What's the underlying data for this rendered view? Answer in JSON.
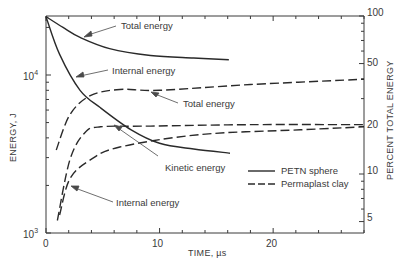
{
  "chart_data": {
    "type": "line",
    "title": "",
    "xlabel": "TIME, µs",
    "ylabel": "ENERGY, J",
    "ylabel_right": "PERCENT TOTAL ENERGY",
    "xlim": [
      0,
      28
    ],
    "ylim": [
      1000,
      23600
    ],
    "yscale": "log",
    "x_ticks": [
      0,
      10,
      20
    ],
    "x_tick_labels": [
      "0",
      "10",
      "20"
    ],
    "y_ticks": [
      1000,
      10000
    ],
    "y_tick_labels": [
      "10^3",
      "10^4"
    ],
    "y_right_ticks": [
      5,
      10,
      20,
      50,
      100
    ],
    "y_right_tick_labels": [
      "5",
      "10",
      "20",
      "50",
      "100"
    ],
    "grid": false,
    "legend": {
      "position": "lower-right",
      "entries": [
        {
          "label": "PETN sphere",
          "style": "solid"
        },
        {
          "label": "Permaplast clay",
          "style": "dashed"
        }
      ]
    },
    "series": [
      {
        "name": "Total energy (PETN sphere)",
        "group": "PETN sphere",
        "style": "solid",
        "x": [
          0,
          1.5,
          3,
          5.6,
          9.2,
          13,
          16.1
        ],
        "y": [
          23400,
          20000,
          17300,
          14700,
          13300,
          12800,
          12500
        ]
      },
      {
        "name": "Internal energy (PETN sphere)",
        "group": "PETN sphere",
        "style": "solid",
        "x": [
          0,
          1.2,
          3,
          4.8,
          7.5,
          10,
          13,
          16.2
        ],
        "y": [
          23400,
          13500,
          8000,
          6200,
          4500,
          3700,
          3400,
          3200
        ]
      },
      {
        "name": "Total energy (Permaplast clay)",
        "group": "Permaplast clay",
        "style": "dashed",
        "x": [
          0.9,
          2.1,
          3.9,
          6.5,
          10,
          18,
          28
        ],
        "y": [
          3350,
          5600,
          7400,
          8100,
          8000,
          8700,
          9400
        ]
      },
      {
        "name": "Kinetic energy (Permaplast clay)",
        "group": "Permaplast clay",
        "style": "dashed",
        "x": [
          1.0,
          2.1,
          3.4,
          4.8,
          9.2,
          18,
          28
        ],
        "y": [
          1200,
          2900,
          4300,
          4700,
          4750,
          4850,
          4850
        ]
      },
      {
        "name": "Internal energy (Permaplast clay)",
        "group": "Permaplast clay",
        "style": "dashed",
        "x": [
          1.2,
          2.1,
          3.9,
          6.5,
          13.6,
          22.4,
          28
        ],
        "y": [
          1300,
          2200,
          2900,
          3500,
          4200,
          4500,
          4700
        ]
      }
    ],
    "annotations": [
      {
        "text": "Total energy",
        "target": "Total energy (PETN sphere)"
      },
      {
        "text": "Internal energy",
        "target": "Internal energy (PETN sphere)"
      },
      {
        "text": "Total energy",
        "target": "Total energy (Permaplast clay)"
      },
      {
        "text": "Kinetic energy",
        "target": "Kinetic energy (Permaplast clay)"
      },
      {
        "text": "Internal energy",
        "target": "Internal energy (Permaplast clay)"
      }
    ]
  },
  "labels": {
    "xlabel": "TIME, µs",
    "ylabel": "ENERGY, J",
    "ylabel_right": "PERCENT TOTAL ENERGY",
    "y_base_1": "10",
    "y_exp_1": "4",
    "y_base_0": "10",
    "y_exp_0": "3",
    "x0": "0",
    "x10": "10",
    "x20": "20",
    "r100": "100",
    "r50": "50",
    "r20": "20",
    "r10": "10",
    "r5": "5",
    "ann_petn_total": "Total energy",
    "ann_petn_internal": "Internal energy",
    "ann_clay_total": "Total energy",
    "ann_clay_kinetic": "Kinetic energy",
    "ann_clay_internal": "Internal energy",
    "legend_solid": "PETN sphere",
    "legend_dashed": "Permaplast clay"
  }
}
